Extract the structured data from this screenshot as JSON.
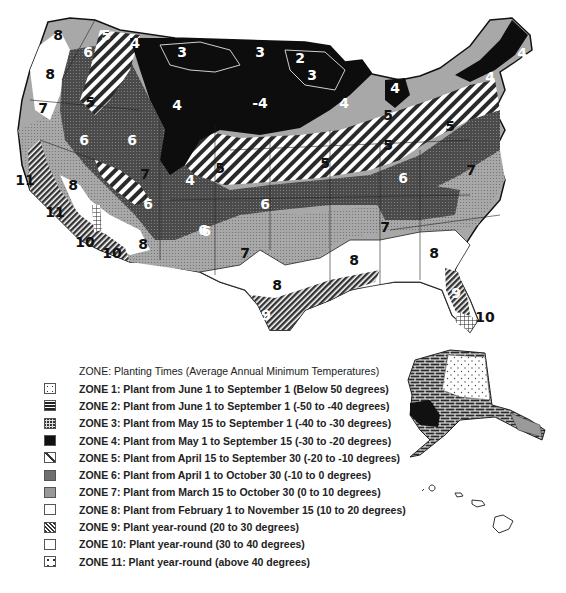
{
  "figure": {
    "title": "ZONE: Planting Times (Average Annual Minimum Temperatures)",
    "caption": "Figure 1.1 (partial, faint)"
  },
  "legend": {
    "title": "ZONE: Planting Times (Average Annual Minimum Temperatures)",
    "items": [
      {
        "zone": 1,
        "pattern": "sparse-dots",
        "label": "ZONE 1: Plant from June 1 to September 1 (Below 50 degrees)"
      },
      {
        "zone": 2,
        "pattern": "brick",
        "label": "ZONE 2: Plant from June 1 to September 1 (-50 to -40 degrees)"
      },
      {
        "zone": 3,
        "pattern": "dark-mottled",
        "label": "ZONE 3: Plant from May 15 to September 1 (-40 to -30 degrees)"
      },
      {
        "zone": 4,
        "pattern": "solid-black",
        "label": "ZONE 4: Plant from May 1 to September 15 (-30 to -20 degrees)"
      },
      {
        "zone": 5,
        "pattern": "diagonal-stripes-white",
        "label": "ZONE 5: Plant from April 15 to September 30 (-20 to -10 degrees)"
      },
      {
        "zone": 6,
        "pattern": "dark-gray-stipple",
        "label": "ZONE 6: Plant from April 1 to October 30 (-10 to 0 degrees)"
      },
      {
        "zone": 7,
        "pattern": "light-gray-stipple",
        "label": "ZONE 7: Plant from March 15 to October 30 (0 to 10 degrees)"
      },
      {
        "zone": 8,
        "pattern": "white",
        "label": "ZONE 8: Plant from February 1 to November 15 (10 to 20 degrees)"
      },
      {
        "zone": 9,
        "pattern": "dense-diagonal-hatch",
        "label": "ZONE 9: Plant year-round (20 to 30 degrees)"
      },
      {
        "zone": 10,
        "pattern": "grid",
        "label": "ZONE 10: Plant year-round (30 to 40 degrees)"
      },
      {
        "zone": 11,
        "pattern": "sparse-dots-white",
        "label": "ZONE 11: Plant year-round (above 40 degrees)"
      }
    ]
  },
  "map": {
    "region": "Contiguous United States",
    "insets": [
      "Alaska",
      "Hawaii"
    ],
    "zone_labels": [
      {
        "text": "8",
        "x": 58,
        "y": 40,
        "dark": true
      },
      {
        "text": "5",
        "x": 106,
        "y": 40,
        "dark": false
      },
      {
        "text": "4",
        "x": 135,
        "y": 48,
        "dark": false
      },
      {
        "text": "6",
        "x": 88,
        "y": 57,
        "dark": false
      },
      {
        "text": "3",
        "x": 182,
        "y": 57,
        "dark": false
      },
      {
        "text": "3",
        "x": 260,
        "y": 57,
        "dark": false
      },
      {
        "text": "2",
        "x": 300,
        "y": 63,
        "dark": false
      },
      {
        "text": "3",
        "x": 312,
        "y": 80,
        "dark": false
      },
      {
        "text": "8",
        "x": 50,
        "y": 79,
        "dark": true
      },
      {
        "text": "4",
        "x": 177,
        "y": 110,
        "dark": false
      },
      {
        "text": "-4",
        "x": 260,
        "y": 108,
        "dark": false
      },
      {
        "text": "4",
        "x": 344,
        "y": 108,
        "dark": false
      },
      {
        "text": "5",
        "x": 90,
        "y": 107,
        "dark": true
      },
      {
        "text": "7",
        "x": 43,
        "y": 113,
        "dark": true
      },
      {
        "text": "6",
        "x": 84,
        "y": 145,
        "dark": false
      },
      {
        "text": "6",
        "x": 132,
        "y": 145,
        "dark": false
      },
      {
        "text": "4",
        "x": 395,
        "y": 93,
        "dark": false
      },
      {
        "text": "4",
        "x": 490,
        "y": 82,
        "dark": false
      },
      {
        "text": "4",
        "x": 522,
        "y": 58,
        "dark": false
      },
      {
        "text": "5",
        "x": 388,
        "y": 120,
        "dark": true
      },
      {
        "text": "5",
        "x": 450,
        "y": 131,
        "dark": true
      },
      {
        "text": "5",
        "x": 388,
        "y": 150,
        "dark": true
      },
      {
        "text": "5",
        "x": 220,
        "y": 173,
        "dark": true
      },
      {
        "text": "5",
        "x": 325,
        "y": 168,
        "dark": true
      },
      {
        "text": "7",
        "x": 145,
        "y": 179,
        "dark": true
      },
      {
        "text": "4",
        "x": 190,
        "y": 185,
        "dark": false
      },
      {
        "text": "6",
        "x": 148,
        "y": 209,
        "dark": false
      },
      {
        "text": "6",
        "x": 265,
        "y": 209,
        "dark": false
      },
      {
        "text": "6",
        "x": 203,
        "y": 235,
        "dark": false
      },
      {
        "text": "6",
        "x": 403,
        "y": 183,
        "dark": false
      },
      {
        "text": "7",
        "x": 471,
        "y": 175,
        "dark": true
      },
      {
        "text": "6",
        "x": 206,
        "y": 236,
        "dark": false
      },
      {
        "text": "7",
        "x": 245,
        "y": 258,
        "dark": true
      },
      {
        "text": "7",
        "x": 385,
        "y": 232,
        "dark": true
      },
      {
        "text": "11",
        "x": 25,
        "y": 185,
        "dark": true
      },
      {
        "text": "8",
        "x": 73,
        "y": 190,
        "dark": true
      },
      {
        "text": "11",
        "x": 55,
        "y": 217,
        "dark": true
      },
      {
        "text": "9",
        "x": 105,
        "y": 233,
        "dark": false
      },
      {
        "text": "10",
        "x": 85,
        "y": 247,
        "dark": true
      },
      {
        "text": "10",
        "x": 112,
        "y": 258,
        "dark": true
      },
      {
        "text": "8",
        "x": 143,
        "y": 249,
        "dark": true
      },
      {
        "text": "8",
        "x": 277,
        "y": 290,
        "dark": true
      },
      {
        "text": "9",
        "x": 266,
        "y": 320,
        "dark": false
      },
      {
        "text": "8",
        "x": 354,
        "y": 265,
        "dark": true
      },
      {
        "text": "8",
        "x": 434,
        "y": 258,
        "dark": true
      },
      {
        "text": "9",
        "x": 456,
        "y": 298,
        "dark": false
      },
      {
        "text": "10",
        "x": 485,
        "y": 322,
        "dark": true
      }
    ]
  }
}
